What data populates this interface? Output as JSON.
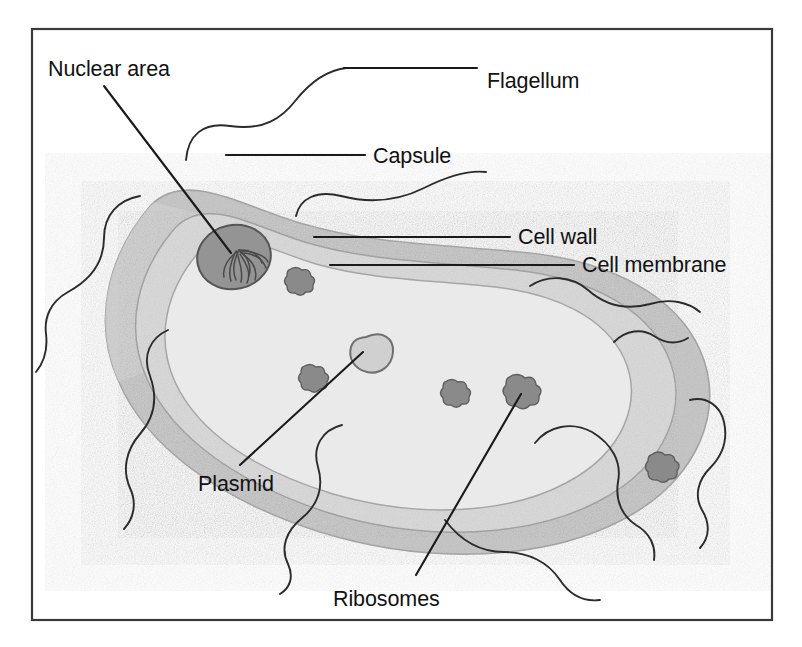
{
  "figure": {
    "name": "prokaryotic-bacterial-cell-diagram",
    "frame": {
      "x": 32,
      "y": 29,
      "width": 740,
      "height": 591,
      "stroke": "#3a3a3a"
    }
  },
  "colors": {
    "capsule_fill": "#c4c4c4",
    "cell_wall_fill": "#b0b0b0",
    "cytoplasm_fill": "#e4e4e4",
    "nucleoid_fill": "#8f8f8f",
    "nucleoid_stroke": "#5a5a5a",
    "plasmid_fill": "#c9c9c9",
    "plasmid_stroke": "#6f6f6f",
    "ribosome_fill": "#8a8a8a",
    "ribosome_stroke": "#5e5e5e",
    "outline": "#9a9a9a",
    "leader_line": "#1a1a1a",
    "flagellum": "#2b2b2b",
    "text": "#121212",
    "background": "#ffffff"
  },
  "labels": [
    {
      "id": "nuclear-area",
      "text": "Nuclear area",
      "x": 48,
      "y": 76,
      "anchor": "start"
    },
    {
      "id": "flagellum",
      "text": "Flagellum",
      "x": 487,
      "y": 88,
      "anchor": "start"
    },
    {
      "id": "capsule",
      "text": "Capsule",
      "x": 373,
      "y": 163,
      "anchor": "start"
    },
    {
      "id": "cell-wall",
      "text": "Cell wall",
      "x": 518,
      "y": 244,
      "anchor": "start"
    },
    {
      "id": "cell-membrane",
      "text": "Cell membrane",
      "x": 582,
      "y": 272,
      "anchor": "start"
    },
    {
      "id": "plasmid",
      "text": "Plasmid",
      "x": 198,
      "y": 491,
      "anchor": "start"
    },
    {
      "id": "ribosomes",
      "text": "Ribosomes",
      "x": 333,
      "y": 606,
      "anchor": "start"
    }
  ],
  "structures": [
    {
      "id": "capsule",
      "name": "Capsule",
      "description": "outermost gray sheath surrounding the rod-shaped cell"
    },
    {
      "id": "cell-wall",
      "name": "Cell wall",
      "description": "rigid band just inside the capsule"
    },
    {
      "id": "cell-membrane",
      "name": "Cell membrane",
      "description": "thin boundary enclosing the cytoplasm"
    },
    {
      "id": "nuclear-area",
      "name": "Nuclear area",
      "description": "nucleoid region with condensed circular chromosome"
    },
    {
      "id": "plasmid",
      "name": "Plasmid",
      "description": "small circular extrachromosomal DNA loop"
    },
    {
      "id": "ribosomes",
      "name": "Ribosomes",
      "description": "granular protein-synthesis particles in cytoplasm"
    },
    {
      "id": "flagellum",
      "name": "Flagellum",
      "description": "long whip-like filaments projecting from the surface"
    }
  ],
  "ribosome_positions": [
    {
      "cx": 296,
      "cy": 281,
      "r": 14
    },
    {
      "cx": 310,
      "cy": 378,
      "r": 14
    },
    {
      "cx": 452,
      "cy": 393,
      "r": 14
    },
    {
      "cx": 521,
      "cy": 392,
      "r": 17
    },
    {
      "cx": 659,
      "cy": 466,
      "r": 15
    }
  ],
  "leader_lines": [
    {
      "id": "nuclear-area-leader",
      "points": "104,86 231,253"
    },
    {
      "id": "flagellum-leader",
      "points": "344,68 477,68"
    },
    {
      "id": "capsule-leader",
      "points": "226,155 365,155"
    },
    {
      "id": "cell-wall-leader",
      "points": "314,237 510,237"
    },
    {
      "id": "cell-membrane-leader",
      "points": "330,265 574,265"
    },
    {
      "id": "plasmid-leader",
      "points": "240,465 363,352"
    },
    {
      "id": "ribosomes-leader",
      "points": "416,575 521,394"
    }
  ]
}
